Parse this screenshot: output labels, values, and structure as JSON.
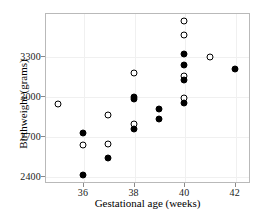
{
  "chart_data": {
    "type": "scatter",
    "title": "",
    "xlabel": "Gestational age (weeks)",
    "ylabel": "Birthweight (grams)",
    "xlim": [
      34.5,
      42.6
    ],
    "ylim": [
      2350,
      3620
    ],
    "xticks": [
      36,
      38,
      40,
      42
    ],
    "yticks": [
      2400,
      2700,
      3000,
      3300
    ],
    "xticklabels": [
      "36",
      "38",
      "40",
      "42"
    ],
    "yticklabels": [
      "2400",
      "2700",
      "3000",
      "3300"
    ],
    "grid": true,
    "legend": "none",
    "series": [
      {
        "name": "open-circles",
        "marker": "open circle",
        "color": "#000000",
        "fill": "#ffffff",
        "points": [
          {
            "x": 35.0,
            "y": 2940
          },
          {
            "x": 36.0,
            "y": 2635
          },
          {
            "x": 37.0,
            "y": 2860
          },
          {
            "x": 37.0,
            "y": 2640
          },
          {
            "x": 38.0,
            "y": 3170
          },
          {
            "x": 38.0,
            "y": 2790
          },
          {
            "x": 40.0,
            "y": 3560
          },
          {
            "x": 40.0,
            "y": 3455
          },
          {
            "x": 40.0,
            "y": 3150
          },
          {
            "x": 40.0,
            "y": 2985
          },
          {
            "x": 41.0,
            "y": 3290
          }
        ]
      },
      {
        "name": "filled-circles",
        "marker": "filled circle",
        "color": "#000000",
        "fill": "#000000",
        "points": [
          {
            "x": 36.0,
            "y": 2720
          },
          {
            "x": 36.0,
            "y": 2410
          },
          {
            "x": 37.0,
            "y": 2540
          },
          {
            "x": 38.0,
            "y": 2995
          },
          {
            "x": 38.0,
            "y": 2975
          },
          {
            "x": 38.0,
            "y": 2750
          },
          {
            "x": 39.0,
            "y": 2900
          },
          {
            "x": 39.0,
            "y": 2830
          },
          {
            "x": 40.0,
            "y": 3310
          },
          {
            "x": 40.0,
            "y": 3230
          },
          {
            "x": 40.0,
            "y": 3120
          },
          {
            "x": 40.0,
            "y": 2950
          },
          {
            "x": 42.0,
            "y": 3200
          }
        ]
      }
    ]
  }
}
